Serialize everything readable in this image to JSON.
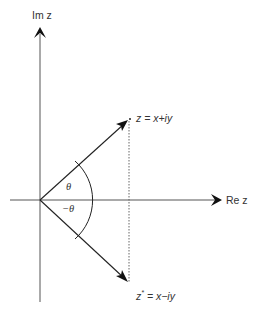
{
  "diagram": {
    "axes": {
      "imag_label": "Im z",
      "real_label": "Re z"
    },
    "points": {
      "z": {
        "label_prefix": "z",
        "label_rest": " = x+iy"
      },
      "zconj": {
        "label_prefix": "z",
        "label_sup": "*",
        "label_rest": " = x−iy"
      }
    },
    "angles": {
      "upper": "θ",
      "lower": "−θ"
    },
    "colors": {
      "axis": "#555555",
      "arrow": "#222222",
      "dotted": "#666666",
      "text": "#333333"
    }
  }
}
